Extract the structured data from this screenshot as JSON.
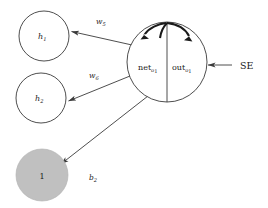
{
  "diagram": {
    "background_color": "#ffffff",
    "stroke_color": "#3a3a3a",
    "bias_fill_color": "#c0c0c0",
    "nodes": [
      {
        "id": "h1",
        "label": "h",
        "subscript": "1",
        "kind": "hidden-neuron",
        "cx": 44,
        "cy": 36,
        "r": 25,
        "fill": "#ffffff"
      },
      {
        "id": "h2",
        "label": "h",
        "subscript": "2",
        "kind": "hidden-neuron",
        "cx": 41,
        "cy": 98,
        "r": 25,
        "fill": "#ffffff"
      },
      {
        "id": "bias",
        "label": "1",
        "subscript": "",
        "kind": "bias-neuron",
        "cx": 42,
        "cy": 175,
        "r": 26,
        "fill": "#c0c0c0"
      },
      {
        "id": "o1",
        "label": "",
        "subscript": "",
        "kind": "output-neuron",
        "cx": 167,
        "cy": 62,
        "r": 40,
        "fill": "#ffffff"
      }
    ],
    "output_node": {
      "net_label": "net",
      "net_subscript": "o",
      "net_subscript_index": "1",
      "out_label": "out",
      "out_subscript": "o",
      "out_subscript_index": "1"
    },
    "edges": [
      {
        "id": "w5",
        "label": "w",
        "subscript": "5",
        "from": "o1",
        "to": "h1",
        "label_x": 96,
        "label_y": 24
      },
      {
        "id": "w6",
        "label": "w",
        "subscript": "6",
        "from": "o1",
        "to": "h2",
        "label_x": 89,
        "label_y": 78
      },
      {
        "id": "b2",
        "label": "b",
        "subscript": "2",
        "from": "o1",
        "to": "bias",
        "label_x": 89,
        "label_y": 180
      }
    ],
    "external_input": {
      "label": "SE",
      "label_x": 240,
      "label_y": 69,
      "arrow_from_x": 232,
      "arrow_to_x": 208,
      "arrow_y": 65
    },
    "self_loop": {
      "description": "double curved arrow over output node",
      "present": true
    }
  }
}
